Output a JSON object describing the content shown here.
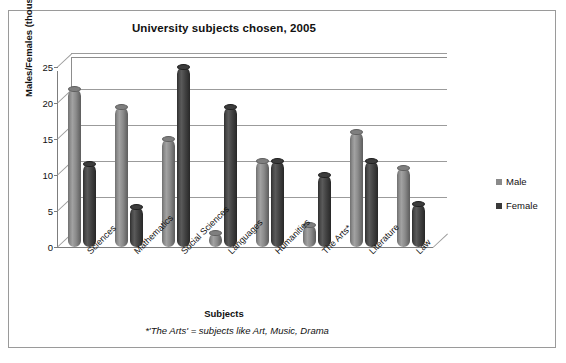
{
  "chart_data": {
    "type": "bar",
    "title": "University subjects chosen, 2005",
    "xlabel": "Subjects",
    "ylabel": "Males/Females (thousands)",
    "footnote": "*'The Arts' = subjects like Art, Music, Drama",
    "categories": [
      "Sciences",
      "Mathematics",
      "Social Sciences",
      "Languages",
      "Humanities",
      "The Arts*",
      "Literature",
      "Law"
    ],
    "series": [
      {
        "name": "Male",
        "color": "#8a8a8a",
        "values": [
          22,
          19.5,
          15,
          2,
          12,
          3,
          16,
          11
        ]
      },
      {
        "name": "Female",
        "color": "#3a3a3a",
        "values": [
          11.5,
          5.5,
          25,
          19.5,
          12,
          10,
          12,
          6
        ]
      }
    ],
    "ylim": [
      0,
      25
    ],
    "yticks": [
      0,
      5,
      10,
      15,
      20,
      25
    ],
    "ytick_labels": [
      "0",
      "5",
      "10",
      "15",
      "20",
      "25"
    ],
    "grid": true,
    "legend_position": "right",
    "style": "3d-cylinder"
  }
}
